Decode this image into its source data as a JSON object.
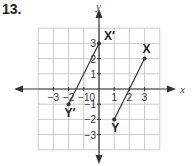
{
  "problem_number": "13.",
  "chart_data": {
    "type": "scatter",
    "title": "",
    "xlabel": "x",
    "ylabel": "y",
    "xlim": [
      -4,
      4
    ],
    "ylim": [
      -4,
      4
    ],
    "grid": true,
    "x_ticks": [
      {
        "value": -3,
        "label": "−3"
      },
      {
        "value": -2,
        "label": "−2"
      },
      {
        "value": -1,
        "label": "−1"
      },
      {
        "value": 1,
        "label": "1"
      },
      {
        "value": 2,
        "label": "2"
      },
      {
        "value": 3,
        "label": "3"
      }
    ],
    "y_ticks": [
      {
        "value": 3,
        "label": "3"
      },
      {
        "value": 2,
        "label": "2"
      },
      {
        "value": 1,
        "label": "1"
      },
      {
        "value": -1,
        "label": "−1"
      },
      {
        "value": -2,
        "label": "−2"
      },
      {
        "value": -3,
        "label": "−3"
      }
    ],
    "origin_label": "0",
    "points": [
      {
        "name": "X",
        "label": "X",
        "x": 3,
        "y": 2
      },
      {
        "name": "Y",
        "label": "Y",
        "x": 1,
        "y": -2
      },
      {
        "name": "X-prime",
        "label": "X′",
        "x": 0,
        "y": 3
      },
      {
        "name": "Y-prime",
        "label": "Y′",
        "x": -2,
        "y": -1
      }
    ],
    "segments": [
      {
        "name": "segment-XY",
        "from": "X",
        "to": "Y"
      },
      {
        "name": "segment-XprimeYprime",
        "from": "X-prime",
        "to": "Y-prime"
      }
    ],
    "colors": {
      "grid": "#bdbdbd",
      "axis": "#333333",
      "segment": "#333333"
    }
  }
}
